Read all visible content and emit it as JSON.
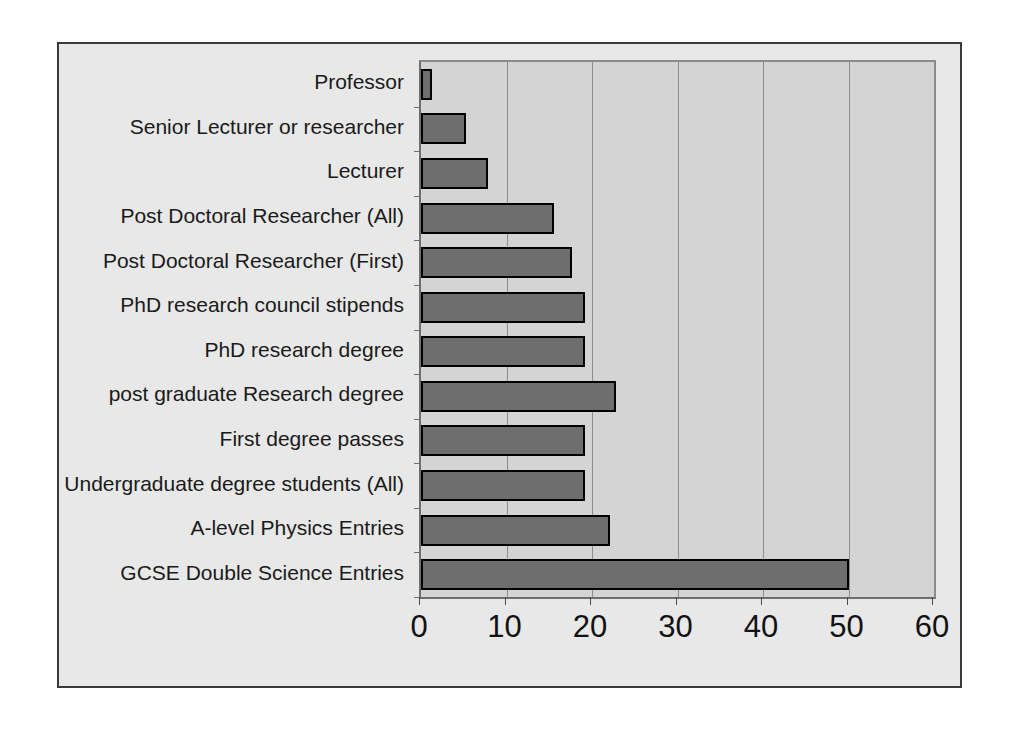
{
  "chart_data": {
    "type": "bar",
    "orientation": "horizontal",
    "title": "",
    "subtitle": "",
    "xlabel": "",
    "ylabel": "",
    "xlim": [
      0,
      60
    ],
    "ylim": null,
    "grid": true,
    "gridlines_axis": "x",
    "legend": false,
    "legend_position": "none",
    "xticks": [
      "0",
      "10",
      "20",
      "30",
      "40",
      "50",
      "60"
    ],
    "xtick_values": [
      0,
      10,
      20,
      30,
      40,
      50,
      60
    ],
    "categories": [
      "Professor",
      "Senior Lecturer or researcher",
      "Lecturer",
      "Post Doctoral Researcher (All)",
      "Post Doctoral Researcher (First)",
      "PhD research council stipends",
      "PhD research degree",
      "post graduate Research degree",
      "First degree passes",
      "Undergraduate degree students (All)",
      "A-level Physics Entries",
      "GCSE Double Science Entries"
    ],
    "values": [
      1.3,
      5.3,
      7.8,
      15.6,
      17.7,
      19.2,
      19.2,
      22.8,
      19.2,
      19.2,
      22.1,
      50.1
    ],
    "series": [
      {
        "name": "percentage",
        "values": [
          1.3,
          5.3,
          7.8,
          15.6,
          17.7,
          19.2,
          19.2,
          22.8,
          19.2,
          19.2,
          22.1,
          50.1
        ]
      }
    ],
    "colors": {
      "bar_fill": "#6e6e6e",
      "bar_border": "#000000",
      "plot_background": "#d4d4d4",
      "chart_background": "#e8e8e8",
      "gridline": "#8d8d8d",
      "frame_border": "#3a3a3a",
      "text": "#121212"
    },
    "annotations": []
  }
}
